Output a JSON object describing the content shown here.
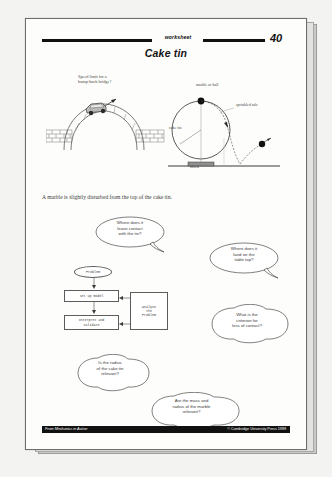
{
  "page": {
    "header": {
      "worksheet_label": "worksheet",
      "page_number": "40",
      "title": "Cake tin"
    },
    "instruction": "A marble is slightly disturbed from the top of the cake tin.",
    "footer": {
      "left": "From Mechanics in Action",
      "right": "© Cambridge University Press 1989"
    }
  },
  "figure_left": {
    "caption": "Speed limit for a\nhump-back bridge?",
    "name": "hump-back-bridge-diagram"
  },
  "figure_right": {
    "name": "cake-tin-diagram",
    "labels": {
      "marble": "marble or ball",
      "sprinkled": "sprinkled talc",
      "cake_tin": "cake tin",
      "block": "block"
    }
  },
  "bubbles": [
    {
      "id": "leave-contact",
      "text": "Where does it\nleave contact\nwith the tin?"
    },
    {
      "id": "land-table",
      "text": "Where does it\nland on the\ntable top?"
    },
    {
      "id": "criterion",
      "text": "What is the\ncriterion for\nloss of contact?"
    },
    {
      "id": "radius-tin",
      "text": "Is the radius\nof the cake tin\nrelevant?"
    },
    {
      "id": "mass-radius-marble",
      "text": "Are the mass and\nradius of the marble\nrelevant?"
    }
  ],
  "flowchart": {
    "problem": "Problem",
    "set_up_model": "Set up model",
    "interpret_validate": "Interpret and\nvalidate",
    "analyse": "Analyse\nthe\nProblem"
  },
  "colors": {
    "ink": "#111111",
    "paper": "#fdfdfc",
    "faded_ink": "#3a3a38",
    "backdrop": "#f3f3f1"
  }
}
